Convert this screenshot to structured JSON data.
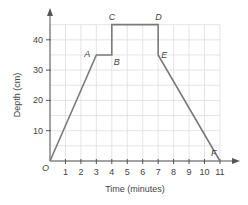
{
  "chart_data": {
    "type": "line",
    "title": "",
    "xlabel": "Time (minutes)",
    "ylabel": "Depth (cm)",
    "xlim": [
      0,
      11
    ],
    "ylim": [
      0,
      45
    ],
    "x_ticks": [
      1,
      2,
      3,
      4,
      5,
      6,
      7,
      8,
      9,
      10,
      11
    ],
    "y_ticks": [
      10,
      20,
      30,
      40
    ],
    "origin_label": "O",
    "grid": true,
    "grid_x_step": 1,
    "grid_y_step": 5,
    "series": [
      {
        "name": "depth",
        "color": "#7a7a7a",
        "points": [
          {
            "label": "O",
            "x": 0,
            "y": 0
          },
          {
            "label": "A",
            "x": 3,
            "y": 35
          },
          {
            "label": "B",
            "x": 4,
            "y": 35
          },
          {
            "label": "C",
            "x": 4,
            "y": 45
          },
          {
            "label": "D",
            "x": 7,
            "y": 45
          },
          {
            "label": "E",
            "x": 7,
            "y": 35
          },
          {
            "label": "F",
            "x": 11,
            "y": 0
          }
        ]
      }
    ],
    "legend": null
  },
  "colors": {
    "axis": "#555555",
    "grid": "#dddddd",
    "line": "#7a7a7a",
    "text": "#444444"
  }
}
